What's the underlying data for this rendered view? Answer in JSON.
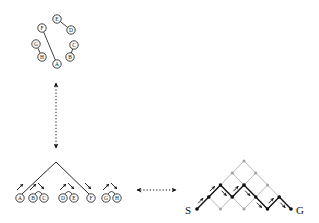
{
  "circle_diagram": {
    "nodes": [
      {
        "id": "E",
        "x": 57,
        "y": 19
      },
      {
        "id": "D",
        "x": 71,
        "y": 30
      },
      {
        "id": "F",
        "x": 42,
        "y": 28
      },
      {
        "id": "G",
        "x": 36,
        "y": 44
      },
      {
        "id": "C",
        "x": 74,
        "y": 45
      },
      {
        "id": "H",
        "x": 42,
        "y": 57
      },
      {
        "id": "B",
        "x": 70,
        "y": 57
      },
      {
        "id": "A",
        "x": 57,
        "y": 64
      }
    ],
    "edges": [
      [
        "E",
        "D"
      ],
      [
        "F",
        "A"
      ],
      [
        "G",
        "H"
      ],
      [
        "C",
        "B"
      ]
    ]
  },
  "tree_diagram": {
    "apex": {
      "x": 56,
      "y": 162
    },
    "leaves": [
      {
        "id": "A",
        "x": 20,
        "y": 198
      },
      {
        "id": "B",
        "x": 33,
        "y": 198
      },
      {
        "id": "C",
        "x": 44,
        "y": 198
      },
      {
        "id": "D",
        "x": 63,
        "y": 198
      },
      {
        "id": "E",
        "x": 74,
        "y": 198
      },
      {
        "id": "F",
        "x": 91,
        "y": 198
      },
      {
        "id": "G",
        "x": 106,
        "y": 198
      },
      {
        "id": "H",
        "x": 117,
        "y": 198
      }
    ],
    "branches_to": [
      "A",
      "F"
    ],
    "arcs": [
      [
        "B",
        "C"
      ],
      [
        "D",
        "E"
      ],
      [
        "G",
        "H"
      ]
    ]
  },
  "lattice_diagram": {
    "start_label": "S",
    "goal_label": "G",
    "origin": {
      "x": 197,
      "y": 209
    },
    "dx": 11.75,
    "dy": 12,
    "steps": 8,
    "path_heights": [
      0,
      1,
      2,
      1,
      2,
      1,
      0,
      1,
      0
    ]
  },
  "arrows": {
    "vertical": {
      "x": 56,
      "y1": 83,
      "y2": 148
    },
    "horizontal": {
      "y": 190,
      "x1": 137,
      "x2": 176
    }
  }
}
